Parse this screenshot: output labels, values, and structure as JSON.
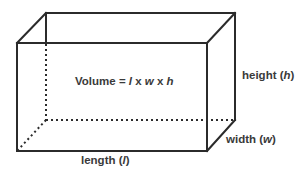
{
  "diagram": {
    "type": "rectangular-prism",
    "formula": {
      "prefix": "Volume = ",
      "l": "l",
      "times1": " x ",
      "w": "w",
      "times2": " x ",
      "h": "h"
    },
    "labels": {
      "height": {
        "text": "height (",
        "var": "h",
        "close": ")"
      },
      "width": {
        "text": "width (",
        "var": "w",
        "close": ")"
      },
      "length": {
        "text": "length (",
        "var": "l",
        "close": ")"
      }
    },
    "colors": {
      "edge": "#2b2b2b",
      "text": "#3a3a3a",
      "background": "#ffffff"
    }
  }
}
